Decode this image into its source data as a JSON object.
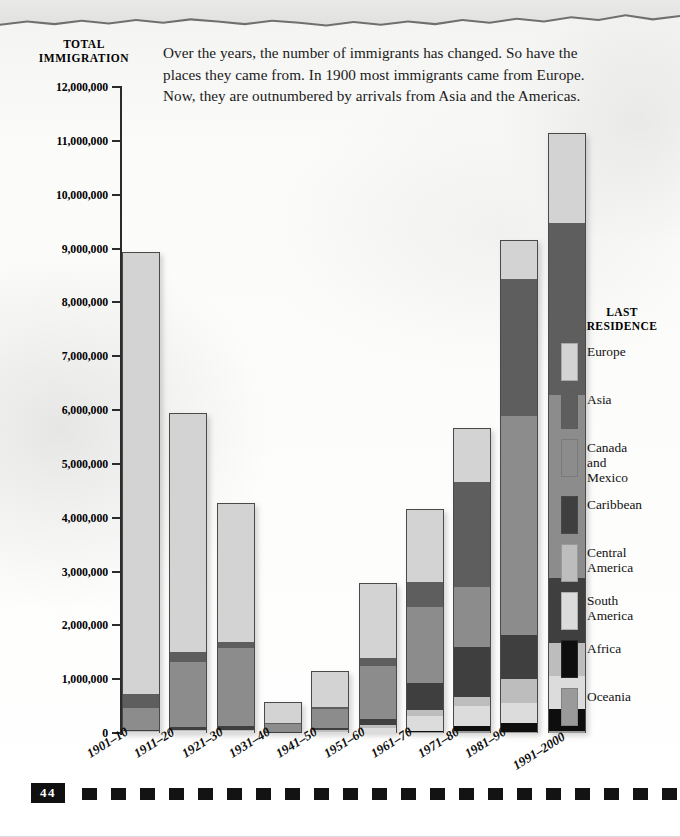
{
  "intro_text": "Over the years, the number of immigrants has changed. So have the places they came from. In 1900 most immigrants came from Europe. Now, they are outnumbered by arrivals from Asia and the Americas.",
  "y_axis_title_line1": "TOTAL",
  "y_axis_title_line2": "IMMIGRATION",
  "legend": {
    "title_line1": "LAST",
    "title_line2": "RESIDENCE",
    "items": [
      {
        "label": "Europe",
        "color": "#d3d3d3",
        "height": 38
      },
      {
        "label": "Asia",
        "color": "#5e5e5e",
        "height": 38
      },
      {
        "label": "Canada\nand\nMexico",
        "color": "#8c8c8c",
        "height": 38
      },
      {
        "label": "Caribbean",
        "color": "#3f3f3f",
        "height": 38
      },
      {
        "label": "Central\nAmerica",
        "color": "#bdbdbd",
        "height": 38
      },
      {
        "label": "South\nAmerica",
        "color": "#dcdcdc",
        "height": 38
      },
      {
        "label": "Africa",
        "color": "#0e0e0e",
        "height": 38
      },
      {
        "label": "Oceania",
        "color": "#9a9a9a",
        "height": 38
      }
    ]
  },
  "page_number": "44",
  "chart_data": {
    "type": "bar",
    "stacked": true,
    "title": "TOTAL IMMIGRATION",
    "xlabel": "",
    "ylabel": "TOTAL IMMIGRATION",
    "ylim": [
      0,
      12000000
    ],
    "ytick_labels": [
      "12,000,000",
      "11,000,000",
      "10,000,000",
      "9,000,000",
      "8,000,000",
      "7,000,000",
      "6,000,000",
      "5,000,000",
      "4,000,000",
      "3,000,000",
      "2,000,000",
      "1,000,000",
      "0"
    ],
    "ytick_values": [
      12000000,
      11000000,
      10000000,
      9000000,
      8000000,
      7000000,
      6000000,
      5000000,
      4000000,
      3000000,
      2000000,
      1000000,
      0
    ],
    "grid": false,
    "legend_position": "right",
    "categories": [
      "1901–10",
      "1911–20",
      "1921–30",
      "1931–40",
      "1941–50",
      "1951–60",
      "1961–70",
      "1971–80",
      "1981–90",
      "1991–2000"
    ],
    "series": [
      {
        "name": "Europe",
        "color": "#d3d3d3",
        "values": [
          8140000,
          4380000,
          2560000,
          350000,
          620000,
          1400000,
          1240000,
          800000,
          760000,
          1450000
        ]
      },
      {
        "name": "Asia",
        "color": "#5e5e5e",
        "values": [
          245000,
          190000,
          100000,
          16000,
          37000,
          150000,
          430000,
          1590000,
          2740000,
          2800000
        ]
      },
      {
        "name": "Canada and Mexico",
        "color": "#8c8c8c",
        "values": [
          410000,
          1200000,
          1450000,
          130000,
          340000,
          1000000,
          1300000,
          900000,
          4380000,
          2990000
        ]
      },
      {
        "name": "Caribbean",
        "color": "#3f3f3f",
        "values": [
          28000,
          48000,
          75000,
          16000,
          50000,
          125000,
          470000,
          760000,
          880000,
          1050000
        ]
      },
      {
        "name": "Central America",
        "color": "#bdbdbd",
        "values": [
          8000,
          17000,
          16000,
          6000,
          21000,
          45000,
          100000,
          135000,
          470000,
          540000
        ]
      },
      {
        "name": "South America",
        "color": "#dcdcdc",
        "values": [
          18000,
          41000,
          42000,
          7000,
          22000,
          92000,
          258000,
          300000,
          400000,
          540000
        ]
      },
      {
        "name": "Africa",
        "color": "#0e0e0e",
        "values": [
          7000,
          8000,
          6000,
          2000,
          7000,
          14000,
          29000,
          80000,
          177000,
          355000
        ]
      },
      {
        "name": "Oceania",
        "color": "#9a9a9a",
        "values": [
          13000,
          13000,
          9000,
          2000,
          15000,
          12000,
          25000,
          40000,
          42000,
          56000
        ]
      }
    ],
    "totals": [
      8869000,
      5897000,
      4258000,
      529000,
      1112000,
      2838000,
      3852000,
      4605000,
      9849000,
      9781000
    ],
    "bar_tops": [
      8930000,
      5940000,
      4270000,
      580000,
      1150000,
      2780000,
      4170000,
      5660000,
      9160000,
      11140000
    ]
  }
}
